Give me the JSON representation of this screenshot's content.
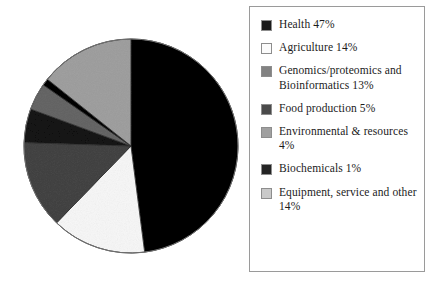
{
  "chart_data": {
    "type": "pie",
    "title": "",
    "start_angle_deg": 90,
    "direction": "clockwise",
    "legend_position": "right",
    "units": "percent",
    "categories": [
      "Health",
      "Agriculture",
      "Genomics/proteomics and Bioinformatics",
      "Food production",
      "Environmental & resources",
      "Biochemicals",
      "Equipment, service and other"
    ],
    "values": [
      47,
      14,
      13,
      5,
      4,
      1,
      14
    ],
    "colors": [
      "#1a1a1a",
      "#fbfbfb",
      "#828282",
      "#4a4a4a",
      "#a0a0a0",
      "#242424",
      "#c9c9c9"
    ],
    "slices": [
      {
        "label": "Health",
        "value": 47,
        "display": "Health 47%",
        "color": "#1a1a1a"
      },
      {
        "label": "Agriculture",
        "value": 14,
        "display": "Agriculture 14%",
        "color": "#fbfbfb"
      },
      {
        "label": "Genomics/proteomics and Bioinformatics",
        "value": 13,
        "display": "Genomics/proteomics and Bioinformatics 13%",
        "color": "#828282"
      },
      {
        "label": "Food production",
        "value": 5,
        "display": "Food production 5%",
        "color": "#4a4a4a"
      },
      {
        "label": "Environmental & resources",
        "value": 4,
        "display": "Environmental & resources 4%",
        "color": "#a0a0a0"
      },
      {
        "label": "Biochemicals",
        "value": 1,
        "display": "Biochemicals 1%",
        "color": "#242424"
      },
      {
        "label": "Equipment, service and other",
        "value": 14,
        "display": "Equipment, service and other 14%",
        "color": "#c9c9c9"
      }
    ]
  },
  "legend": {
    "items": [
      {
        "text": "Health 47%",
        "color": "#1a1a1a"
      },
      {
        "text": "Agriculture 14%",
        "color": "#fbfbfb"
      },
      {
        "text": "Genomics/proteomics and Bioinformatics 13%",
        "color": "#828282"
      },
      {
        "text": "Food production 5%",
        "color": "#4a4a4a"
      },
      {
        "text": "Environmental & resources 4%",
        "color": "#a0a0a0"
      },
      {
        "text": "Biochemicals 1%",
        "color": "#242424"
      },
      {
        "text": "Equipment, service and other 14%",
        "color": "#c9c9c9"
      }
    ]
  }
}
